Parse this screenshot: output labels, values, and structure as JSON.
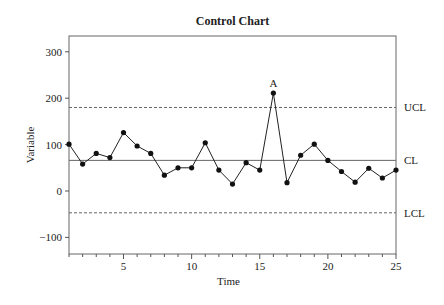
{
  "chart_data": {
    "type": "line",
    "title": "Control Chart",
    "xlabel": "Time",
    "ylabel": "Variable",
    "xlim": [
      1,
      25
    ],
    "ylim": [
      -135,
      335
    ],
    "xticks": [
      5,
      10,
      15,
      20,
      25
    ],
    "yticks": [
      -100,
      0,
      100,
      200,
      300
    ],
    "grid": false,
    "x": [
      1,
      2,
      3,
      4,
      5,
      6,
      7,
      8,
      9,
      10,
      11,
      12,
      13,
      14,
      15,
      16,
      17,
      18,
      19,
      20,
      21,
      22,
      23,
      24,
      25
    ],
    "series": [
      {
        "name": "Variable",
        "values": [
          101,
          58,
          81,
          72,
          126,
          97,
          81,
          34,
          50,
          50,
          104,
          45,
          15,
          61,
          45,
          211,
          18,
          77,
          101,
          66,
          42,
          19,
          49,
          28,
          45
        ]
      }
    ],
    "control_lines": [
      {
        "name": "UCL",
        "value": 180,
        "style": "dashed"
      },
      {
        "name": "CL",
        "value": 66,
        "style": "solid"
      },
      {
        "name": "LCL",
        "value": -47,
        "style": "dashed"
      }
    ],
    "annotations": [
      {
        "text": "A",
        "x": 16,
        "y": 211
      }
    ]
  }
}
